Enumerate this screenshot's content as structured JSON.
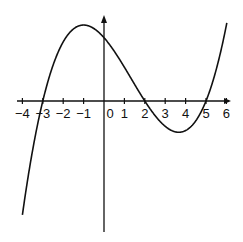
{
  "chart_data": {
    "type": "line",
    "title": "",
    "xlabel": "",
    "ylabel": "",
    "x_ticks": [
      "-4",
      "-3",
      "-2",
      "-1",
      "0",
      "1",
      "2",
      "3",
      "4",
      "5",
      "6"
    ],
    "xlim": [
      -4,
      6
    ],
    "grid": false,
    "legend": null,
    "series": [
      {
        "name": "cubic curve",
        "description": "Cubic with roots at x = -3, 2, 5; local maximum near x = -1, local minimum near x = 3.7",
        "roots": [
          -3,
          2,
          5
        ],
        "local_max_x": -1,
        "local_min_x": 3.7,
        "x": [
          -4,
          -3,
          -2,
          -1,
          0,
          1,
          2,
          3,
          4,
          5,
          6
        ],
        "y_relative": [
          -54,
          0,
          28,
          36,
          30,
          16,
          0,
          -12,
          -14,
          0,
          36
        ]
      }
    ],
    "colors": {
      "curve": "#111111",
      "axes": "#111111"
    }
  }
}
